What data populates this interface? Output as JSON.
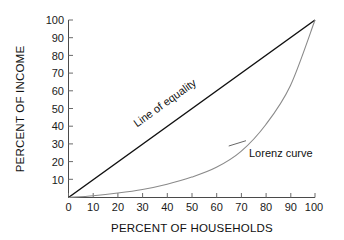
{
  "chart_data": {
    "type": "line",
    "title": "",
    "xlabel": "PERCENT OF HOUSEHOLDS",
    "ylabel": "PERCENT OF INCOME",
    "xlim": [
      0,
      100
    ],
    "ylim": [
      0,
      100
    ],
    "xticks": [
      "0",
      "10",
      "20",
      "30",
      "40",
      "50",
      "60",
      "70",
      "80",
      "90",
      "100"
    ],
    "yticks": [
      "10",
      "20",
      "30",
      "40",
      "50",
      "60",
      "70",
      "80",
      "90",
      "100"
    ],
    "grid": false,
    "legend_position": "inline-annotations",
    "series": [
      {
        "name": "Line of equality",
        "color": "#111111",
        "x": [
          0,
          10,
          20,
          30,
          40,
          50,
          60,
          70,
          80,
          90,
          100
        ],
        "values": [
          0,
          10,
          20,
          30,
          40,
          50,
          60,
          70,
          80,
          90,
          100
        ]
      },
      {
        "name": "Lorenz curve",
        "color": "#8a8a8a",
        "x": [
          0,
          10,
          20,
          30,
          40,
          50,
          60,
          70,
          80,
          90,
          100
        ],
        "values": [
          0,
          1,
          2.5,
          4.5,
          7.5,
          11.5,
          17,
          26,
          41,
          63,
          100
        ]
      }
    ],
    "annotations": [
      {
        "id": "equality-label",
        "text": "Line of equality",
        "x": 40,
        "y": 48,
        "rotation": -35.6
      },
      {
        "id": "lorenz-label",
        "text": "Lorenz curve",
        "x": 76,
        "y": 26,
        "leader_from": [
          72,
          32
        ],
        "leader_to": [
          65,
          29
        ]
      }
    ]
  },
  "axes": {
    "x_title": "PERCENT OF HOUSEHOLDS",
    "y_title": "PERCENT OF INCOME"
  },
  "annotations": {
    "equality": "Line of equality",
    "lorenz": "Lorenz curve"
  },
  "colors": {
    "background": "#ffffff",
    "equality_line": "#111111",
    "lorenz_line": "#8a8a8a",
    "axis": "#4a4a4a",
    "text": "#111111"
  }
}
